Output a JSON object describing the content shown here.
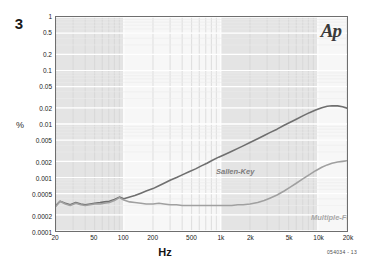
{
  "figure": {
    "number": "3",
    "code": "054034 - 13",
    "logo": "Ap",
    "logo_name": "audio-precision-logo"
  },
  "axes": {
    "y_unit": "%",
    "x_title": "Hz",
    "y_ticks": [
      "1",
      "0.5",
      "0.2",
      "0.1",
      "0.05",
      "0.02",
      "0.01",
      "0.005",
      "0.002",
      "0.001",
      "0.0005",
      "0.0002",
      "0.0001"
    ],
    "x_ticks": [
      "20",
      "50",
      "100",
      "200",
      "500",
      "1k",
      "2k",
      "5k",
      "10k",
      "20k"
    ]
  },
  "chart_data": {
    "type": "line",
    "title": "",
    "subtitle": "",
    "xlabel": "Hz",
    "ylabel": "%",
    "xscale": "log",
    "yscale": "log",
    "xlim": [
      20,
      20000
    ],
    "ylim": [
      0.0001,
      1
    ],
    "grid": true,
    "legend": "inline-annotations",
    "annotations": [
      {
        "text": "Sallen-Key",
        "x": 420,
        "y": 0.0035
      },
      {
        "text": "Multiple-Feedback",
        "x": 6500,
        "y": 0.00037
      },
      {
        "text": "Ap",
        "x": 17000,
        "y": 0.7
      }
    ],
    "x": [
      20,
      22,
      25,
      28,
      32,
      36,
      40,
      45,
      50,
      57,
      63,
      71,
      80,
      90,
      100,
      115,
      130,
      150,
      170,
      200,
      230,
      260,
      300,
      350,
      400,
      470,
      550,
      630,
      720,
      820,
      950,
      1100,
      1300,
      1500,
      1700,
      2000,
      2400,
      2800,
      3200,
      3800,
      4500,
      5200,
      6000,
      7000,
      8200,
      9500,
      11000,
      12500,
      14000,
      16000,
      18000,
      20000
    ],
    "series": [
      {
        "name": "Sallen-Key",
        "color": "#6f6f6f",
        "values": [
          0.0003,
          0.00036,
          0.00033,
          0.00031,
          0.00034,
          0.00032,
          0.00031,
          0.00032,
          0.00033,
          0.00034,
          0.00035,
          0.00036,
          0.00039,
          0.00043,
          0.0004,
          0.00043,
          0.00046,
          0.00051,
          0.00056,
          0.00062,
          0.0007,
          0.00078,
          0.00089,
          0.001,
          0.00112,
          0.00128,
          0.00145,
          0.00165,
          0.00185,
          0.0021,
          0.0024,
          0.0027,
          0.0031,
          0.0035,
          0.0039,
          0.0045,
          0.0053,
          0.0061,
          0.0069,
          0.008,
          0.0095,
          0.0108,
          0.0123,
          0.0142,
          0.0163,
          0.0182,
          0.0202,
          0.0215,
          0.022,
          0.0218,
          0.021,
          0.0198
        ]
      },
      {
        "name": "Multiple-Feedback",
        "color": "#a0a0a0",
        "values": [
          0.00029,
          0.00036,
          0.00032,
          0.0003,
          0.00033,
          0.00031,
          0.0003,
          0.00031,
          0.00032,
          0.00032,
          0.00033,
          0.00034,
          0.00037,
          0.00042,
          0.00038,
          0.00035,
          0.00034,
          0.00033,
          0.00032,
          0.00032,
          0.00033,
          0.00032,
          0.00031,
          0.00031,
          0.0003,
          0.0003,
          0.0003,
          0.0003,
          0.0003,
          0.0003,
          0.0003,
          0.0003,
          0.0003,
          0.00031,
          0.00031,
          0.00032,
          0.00034,
          0.00037,
          0.00041,
          0.00047,
          0.00056,
          0.00066,
          0.00078,
          0.00094,
          0.00113,
          0.00134,
          0.00155,
          0.00172,
          0.00185,
          0.00195,
          0.002,
          0.00205
        ]
      }
    ],
    "decade_bands": [
      {
        "from": 20,
        "to": 100,
        "shade": "dark"
      },
      {
        "from": 100,
        "to": 1000,
        "shade": "light"
      },
      {
        "from": 1000,
        "to": 10000,
        "shade": "dark"
      },
      {
        "from": 10000,
        "to": 20000,
        "shade": "light"
      }
    ]
  }
}
